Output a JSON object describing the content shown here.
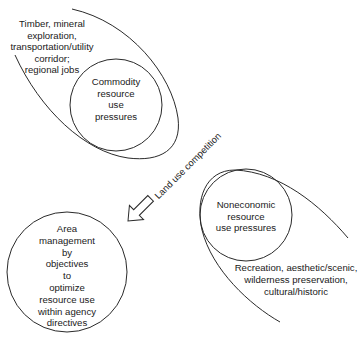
{
  "diagram": {
    "nodes": {
      "commodity_context": "Timber, mineral\nexploration,\ntransportation/utility\ncorridor;\nregional jobs",
      "commodity": "Commodity\nresource\nuse\npressures",
      "noneconomic": "Noneconomic\nresource\nuse pressures",
      "noneconomic_context": "Recreation, aesthetic/scenic,\nwilderness preservation,\ncultural/historic",
      "management": "Area\nmanagement\nby\nobjectives\nto\noptimize\nresource use\nwithin agency\ndirectives"
    },
    "edges": {
      "competition_label": "Land use competition"
    },
    "colors": {
      "stroke": "#2a2a2a",
      "text": "#1a1a1a",
      "background": "#ffffff"
    }
  }
}
